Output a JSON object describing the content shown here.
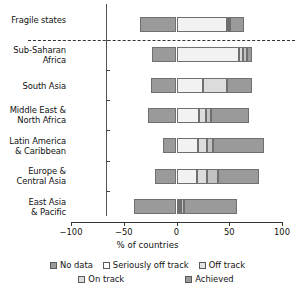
{
  "chart_data": {
    "type": "bar",
    "orientation": "horizontal",
    "stacked": true,
    "title": "",
    "xlabel": "% of countries",
    "ylabel": "",
    "xlim": [
      -100,
      100
    ],
    "xticks": [
      -100,
      -50,
      0,
      50,
      100
    ],
    "xticklabels": [
      "−100",
      "−50",
      "0",
      "50",
      "100"
    ],
    "grid": false,
    "legend_position": "bottom",
    "separator_after_category": "Fragile states",
    "categories": [
      "Fragile states",
      "Sub-Saharan\nAfrica",
      "South Asia",
      "Middle East &\nNorth Africa",
      "Latin America\n& Caribbean",
      "Europe &\nCentral Asia",
      "East Asia\n& Pacific"
    ],
    "series": [
      {
        "name": "No data",
        "color": "#9a9a9a",
        "values": [
          -35,
          -23,
          -24,
          -27,
          -13,
          -20,
          -40
        ]
      },
      {
        "name": "Seriously off track",
        "color": "#f2f2f2",
        "values": [
          48,
          59,
          25,
          21,
          20,
          19,
          2
        ]
      },
      {
        "name": "Off track",
        "color": "#dcdcdc",
        "values": [
          1,
          4,
          23,
          7,
          9,
          10,
          2
        ]
      },
      {
        "name": "On track",
        "color": "#c2c2c2",
        "values": [
          2,
          4,
          0,
          5,
          6,
          10,
          3
        ]
      },
      {
        "name": "Achieved",
        "color": "#9a9a9a",
        "values": [
          13,
          5,
          24,
          36,
          48,
          39,
          50
        ]
      }
    ],
    "legend_entries": [
      {
        "label": "No data",
        "color": "#9a9a9a"
      },
      {
        "label": "Seriously off track",
        "color": "#f2f2f2"
      },
      {
        "label": "Off track",
        "color": "#dcdcdc"
      },
      {
        "label": "On track",
        "color": "#c2c2c2"
      },
      {
        "label": "Achieved",
        "color": "#9a9a9a"
      }
    ]
  },
  "axis": {
    "xlabel": "% of countries",
    "ticklabels": [
      "−100",
      "−50",
      "0",
      "50",
      "100"
    ]
  },
  "legend": {
    "row1": [
      {
        "label": "No data"
      },
      {
        "label": "Seriously off track"
      },
      {
        "label": "Off track"
      }
    ],
    "row2": [
      {
        "label": "On track"
      },
      {
        "label": "Achieved"
      }
    ]
  },
  "categories": {
    "c0": "Fragile states",
    "c1": "Sub-Saharan\nAfrica",
    "c2": "South Asia",
    "c3": "Middle East &\nNorth Africa",
    "c4": "Latin America\n& Caribbean",
    "c5": "Europe &\nCentral Asia",
    "c6": "East Asia\n& Pacific"
  }
}
